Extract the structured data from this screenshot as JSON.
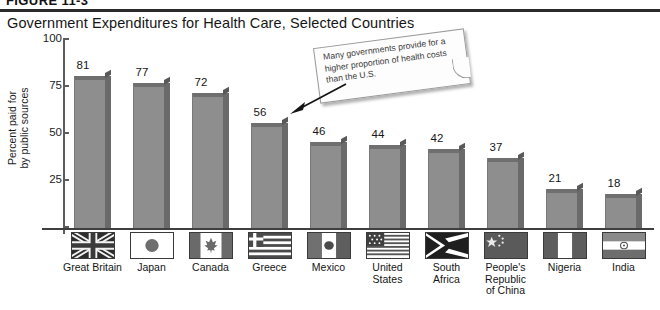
{
  "figure": {
    "figure_label": "FIGURE 11-3",
    "title": "Government Expenditures for Health Care, Selected Countries"
  },
  "callout": {
    "text": "Many governments provide for a higher proportion of health costs than the U.S.",
    "arrow": "arrow-pointing-to-greece-bar"
  },
  "colors": {
    "bar_face": "#8e8e8e",
    "bar_side": "#6a6a6a",
    "bar_top": "#6f6f6f",
    "axis": "#3f3f3f",
    "rule": "#2b2b2b",
    "text": "#161616"
  },
  "chart_data": {
    "type": "bar",
    "title": "Government Expenditures for Health Care, Selected Countries",
    "xlabel": "",
    "ylabel": "Percent paid for by public sources",
    "ylabel_line1": "Percent paid for",
    "ylabel_line2": "by public sources",
    "ylim": [
      0,
      100
    ],
    "yticks": [
      100,
      75,
      50,
      25
    ],
    "ytick_labels": [
      "100",
      "75",
      "50",
      "25"
    ],
    "grid": false,
    "legend": "none",
    "categories": [
      "Great Britain",
      "Japan",
      "Canada",
      "Greece",
      "Mexico",
      "United States",
      "South Africa",
      "People's Republic of China",
      "Nigeria",
      "India"
    ],
    "category_lines": [
      [
        "Great Britain"
      ],
      [
        "Japan"
      ],
      [
        "Canada"
      ],
      [
        "Greece"
      ],
      [
        "Mexico"
      ],
      [
        "United",
        "States"
      ],
      [
        "South",
        "Africa"
      ],
      [
        "People's",
        "Republic",
        "of China"
      ],
      [
        "Nigeria"
      ],
      [
        "India"
      ]
    ],
    "values": [
      81,
      77,
      72,
      56,
      46,
      44,
      42,
      37,
      21,
      18
    ],
    "value_labels": [
      "81",
      "77",
      "72",
      "56",
      "46",
      "44",
      "42",
      "37",
      "21",
      "18"
    ],
    "flag_icons": [
      "flag-great-britain-icon",
      "flag-japan-icon",
      "flag-canada-icon",
      "flag-greece-icon",
      "flag-mexico-icon",
      "flag-united-states-icon",
      "flag-south-africa-icon",
      "flag-china-icon",
      "flag-nigeria-icon",
      "flag-india-icon"
    ]
  }
}
